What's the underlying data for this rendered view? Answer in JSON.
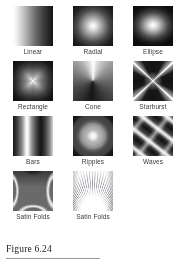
{
  "figure": {
    "caption": "Figure 6.24",
    "background_color": "#ffffff",
    "label_color": "#3a3a3a",
    "rule_color": "#9a9a9a"
  },
  "swatches": [
    {
      "label": "Linear",
      "icon": "linear-gradient-swatch"
    },
    {
      "label": "Radial",
      "icon": "radial-gradient-swatch"
    },
    {
      "label": "Ellipse",
      "icon": "ellipse-gradient-swatch"
    },
    {
      "label": "Rectangle",
      "icon": "rectangle-gradient-swatch"
    },
    {
      "label": "Cone",
      "icon": "cone-gradient-swatch"
    },
    {
      "label": "Starburst",
      "icon": "starburst-gradient-swatch"
    },
    {
      "label": "Bars",
      "icon": "bars-gradient-swatch"
    },
    {
      "label": "Ripples",
      "icon": "ripples-gradient-swatch"
    },
    {
      "label": "Waves",
      "icon": "waves-gradient-swatch"
    },
    {
      "label": "Satin Folds",
      "icon": "satin-folds-a-gradient-swatch"
    },
    {
      "label": "Satin Folds",
      "icon": "satin-folds-b-gradient-swatch"
    }
  ]
}
